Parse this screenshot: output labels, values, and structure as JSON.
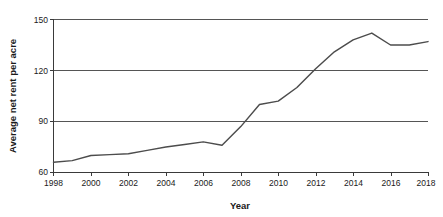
{
  "chart_data": {
    "type": "line",
    "title": "",
    "xlabel": "Year",
    "ylabel": "Average net rent per acre",
    "xlim": [
      1998,
      2018
    ],
    "ylim": [
      60,
      150
    ],
    "grid": true,
    "legend": false,
    "y_ticks": [
      60,
      90,
      120,
      150
    ],
    "y_tick_labels": [
      "60",
      "90",
      "120",
      "150"
    ],
    "x_ticks": [
      1998,
      1999,
      2000,
      2001,
      2002,
      2003,
      2004,
      2005,
      2006,
      2007,
      2008,
      2009,
      2010,
      2011,
      2012,
      2013,
      2014,
      2015,
      2016,
      2017,
      2018
    ],
    "x_tick_labels_shown": [
      "1998",
      "2000",
      "2002",
      "2004",
      "2006",
      "2008",
      "2010",
      "2012",
      "2014",
      "2016",
      "2018"
    ],
    "x": [
      1998,
      1999,
      2000,
      2001,
      2002,
      2003,
      2004,
      2005,
      2006,
      2007,
      2008,
      2009,
      2010,
      2011,
      2012,
      2013,
      2014,
      2015,
      2016,
      2017,
      2018
    ],
    "values": [
      66,
      67,
      70,
      70.5,
      71,
      73,
      75,
      76.5,
      78,
      76,
      87,
      100,
      102,
      110,
      121,
      131,
      138,
      142,
      135,
      135,
      137
    ],
    "series": [
      {
        "name": "Average net rent per acre",
        "color": "#4c4c4c",
        "values": [
          66,
          67,
          70,
          70.5,
          71,
          73,
          75,
          76.5,
          78,
          76,
          87,
          100,
          102,
          110,
          121,
          131,
          138,
          142,
          135,
          135,
          137
        ]
      }
    ],
    "colors": {
      "line": "#4c4c4c",
      "gridline": "#555555",
      "axis": "#3a3a3a",
      "text": "#1a1a1a",
      "background": "#ffffff"
    }
  },
  "axes": {
    "y_title": "Average net rent per acre",
    "x_title": "Year"
  }
}
